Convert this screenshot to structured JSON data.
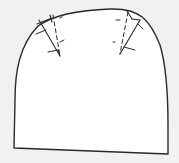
{
  "diagram": {
    "type": "sewing-pattern-piece",
    "colors": {
      "background": "#f1f1f1",
      "piece_fill": "#ffffff",
      "line": "#2a2a2a"
    },
    "shape": {
      "outline": "rounded-top rectangle",
      "darts": [
        {
          "id": "left-dart",
          "position": "upper-left",
          "stitch_line": "dashed"
        },
        {
          "id": "right-dart",
          "position": "upper-right",
          "stitch_line": "dashed"
        }
      ]
    }
  }
}
